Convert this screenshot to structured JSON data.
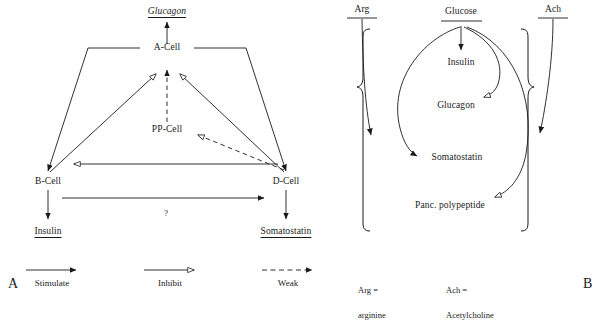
{
  "figure": {
    "panel_a": {
      "letter": "A",
      "nodes": {
        "glucagon": "Glucagon",
        "a_cell": "A-Cell",
        "pp_cell": "PP-Cell",
        "b_cell": "B-Cell",
        "d_cell": "D-Cell",
        "insulin": "Insulin",
        "somatostatin": "Somatostatin"
      },
      "question_mark": "?",
      "legend": [
        {
          "label": "Stimulate",
          "arrow": "solid-filled-arrow"
        },
        {
          "label": "Inhibit",
          "arrow": "solid-open-arrow"
        },
        {
          "label": "Weak",
          "arrow": "dashed-filled-arrow"
        }
      ]
    },
    "panel_b": {
      "letter": "B",
      "nodes": {
        "arg": "Arg",
        "glucose": "Glucose",
        "ach": "Ach",
        "insulin": "Insulin",
        "glucagon": "Glucagon",
        "somatostatin": "Somatostatin",
        "panc_polypeptide": "Panc. polypeptide"
      },
      "abbreviations": [
        {
          "term": "Arg =",
          "expansion": "arginine"
        },
        {
          "term": "Ach =",
          "expansion": "Acetylcholine"
        }
      ]
    },
    "colors": {
      "ink": "#1a1a1a",
      "stroke": "#222222"
    }
  }
}
